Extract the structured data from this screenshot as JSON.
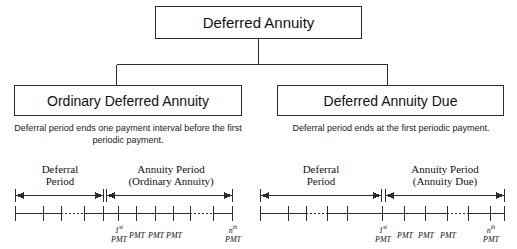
{
  "diagram": {
    "title_text": "Deferred Annuity",
    "root": {
      "label": "Deferred Annuity"
    },
    "branches": [
      {
        "id": "ordinary",
        "label": "Ordinary Deferred Annuity",
        "caption": "Deferral period ends one payment interval before the first periodic payment.",
        "timeline": {
          "deferral_heading_line1": "Deferral",
          "deferral_heading_line2": "Period",
          "annuity_heading_line1": "Annuity Period",
          "annuity_heading_line2": "(Ordinary Annuity)",
          "payment_labels": [
            {
              "sup": "st",
              "base": "1",
              "word": "PMT",
              "stacked": true
            },
            {
              "sup": "",
              "base": "",
              "word": "PMT",
              "stacked": false
            },
            {
              "sup": "",
              "base": "",
              "word": "PMT",
              "stacked": false
            },
            {
              "sup": "",
              "base": "",
              "word": "PMT",
              "stacked": false
            },
            {
              "sup": "th",
              "base": "n",
              "word": "PMT",
              "stacked": true
            }
          ]
        }
      },
      {
        "id": "due",
        "label": "Deferred Annuity Due",
        "caption": "Deferral period ends at the first periodic payment.",
        "timeline": {
          "deferral_heading_line1": "Deferral",
          "deferral_heading_line2": "Period",
          "annuity_heading_line1": "Annuity Period",
          "annuity_heading_line2": "(Annuity Due)",
          "payment_labels": [
            {
              "sup": "st",
              "base": "1",
              "word": "PMT",
              "stacked": true
            },
            {
              "sup": "",
              "base": "",
              "word": "PMT",
              "stacked": false
            },
            {
              "sup": "",
              "base": "",
              "word": "PMT",
              "stacked": false
            },
            {
              "sup": "",
              "base": "",
              "word": "PMT",
              "stacked": false
            },
            {
              "sup": "th",
              "base": "n",
              "word": "PMT",
              "stacked": true
            }
          ]
        }
      }
    ],
    "colors": {
      "line": "#2b2b2b",
      "background": "#ffffff",
      "text": "#111111"
    }
  }
}
